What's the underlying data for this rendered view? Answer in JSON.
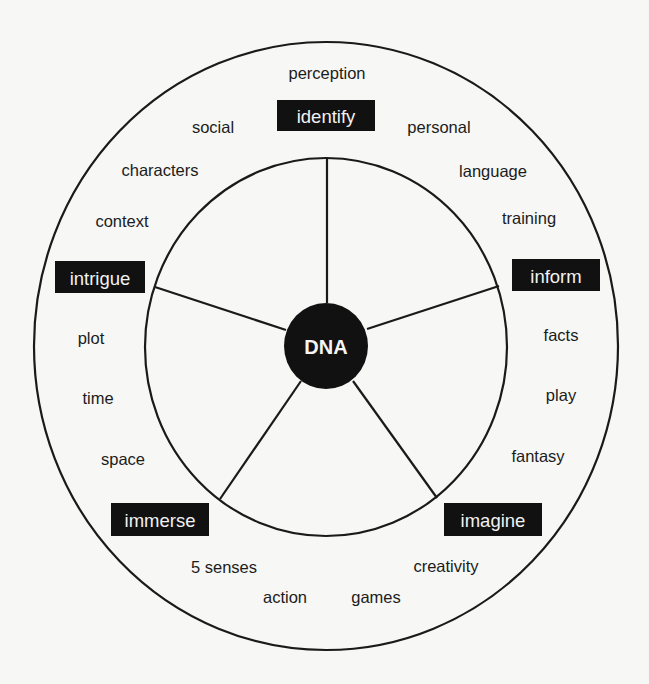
{
  "diagram": {
    "center": {
      "label": "DNA",
      "cx": 326,
      "cy": 346,
      "rx": 42,
      "ry": 43
    },
    "outer_ring": {
      "cx": 326,
      "cy": 346,
      "rx": 292,
      "ry": 304
    },
    "inner_ring": {
      "cx": 326,
      "cy": 347,
      "rx": 181,
      "ry": 189
    },
    "colors": {
      "line": "#1a1a1a",
      "fill_dark": "#111111",
      "text_light": "#f2f2f2",
      "text_dark": "#1c1c1c",
      "background": "#f7f7f5"
    },
    "categories": [
      {
        "id": "identify",
        "label": "identify",
        "box": {
          "x": 277,
          "y": 100,
          "w": 98,
          "h": 31
        }
      },
      {
        "id": "inform",
        "label": "inform",
        "box": {
          "x": 512,
          "y": 259,
          "w": 88,
          "h": 32
        }
      },
      {
        "id": "imagine",
        "label": "imagine",
        "box": {
          "x": 444,
          "y": 503,
          "w": 98,
          "h": 33
        }
      },
      {
        "id": "immerse",
        "label": "immerse",
        "box": {
          "x": 111,
          "y": 503,
          "w": 98,
          "h": 33
        }
      },
      {
        "id": "intrigue",
        "label": "intrigue",
        "box": {
          "x": 55,
          "y": 261,
          "w": 90,
          "h": 32
        }
      }
    ],
    "terms": [
      {
        "label": "perception",
        "x": 327,
        "y": 79
      },
      {
        "label": "social",
        "x": 213,
        "y": 133
      },
      {
        "label": "personal",
        "x": 439,
        "y": 133
      },
      {
        "label": "characters",
        "x": 160,
        "y": 176
      },
      {
        "label": "language",
        "x": 493,
        "y": 177
      },
      {
        "label": "context",
        "x": 122,
        "y": 227
      },
      {
        "label": "training",
        "x": 529,
        "y": 224
      },
      {
        "label": "plot",
        "x": 91,
        "y": 344
      },
      {
        "label": "facts",
        "x": 561,
        "y": 341
      },
      {
        "label": "time",
        "x": 98,
        "y": 404
      },
      {
        "label": "play",
        "x": 561,
        "y": 401
      },
      {
        "label": "space",
        "x": 123,
        "y": 465
      },
      {
        "label": "fantasy",
        "x": 538,
        "y": 462
      },
      {
        "label": "5 senses",
        "x": 224,
        "y": 573
      },
      {
        "label": "creativity",
        "x": 446,
        "y": 572
      },
      {
        "label": "action",
        "x": 285,
        "y": 603
      },
      {
        "label": "games",
        "x": 376,
        "y": 603
      }
    ],
    "spokes": [
      {
        "x1": 327,
        "y1": 158,
        "x2": 327,
        "y2": 303
      },
      {
        "x1": 499,
        "y1": 286,
        "x2": 367,
        "y2": 329
      },
      {
        "x1": 437,
        "y1": 498,
        "x2": 353,
        "y2": 381
      },
      {
        "x1": 220,
        "y1": 499,
        "x2": 301,
        "y2": 381
      },
      {
        "x1": 155,
        "y1": 287,
        "x2": 286,
        "y2": 330
      }
    ]
  }
}
